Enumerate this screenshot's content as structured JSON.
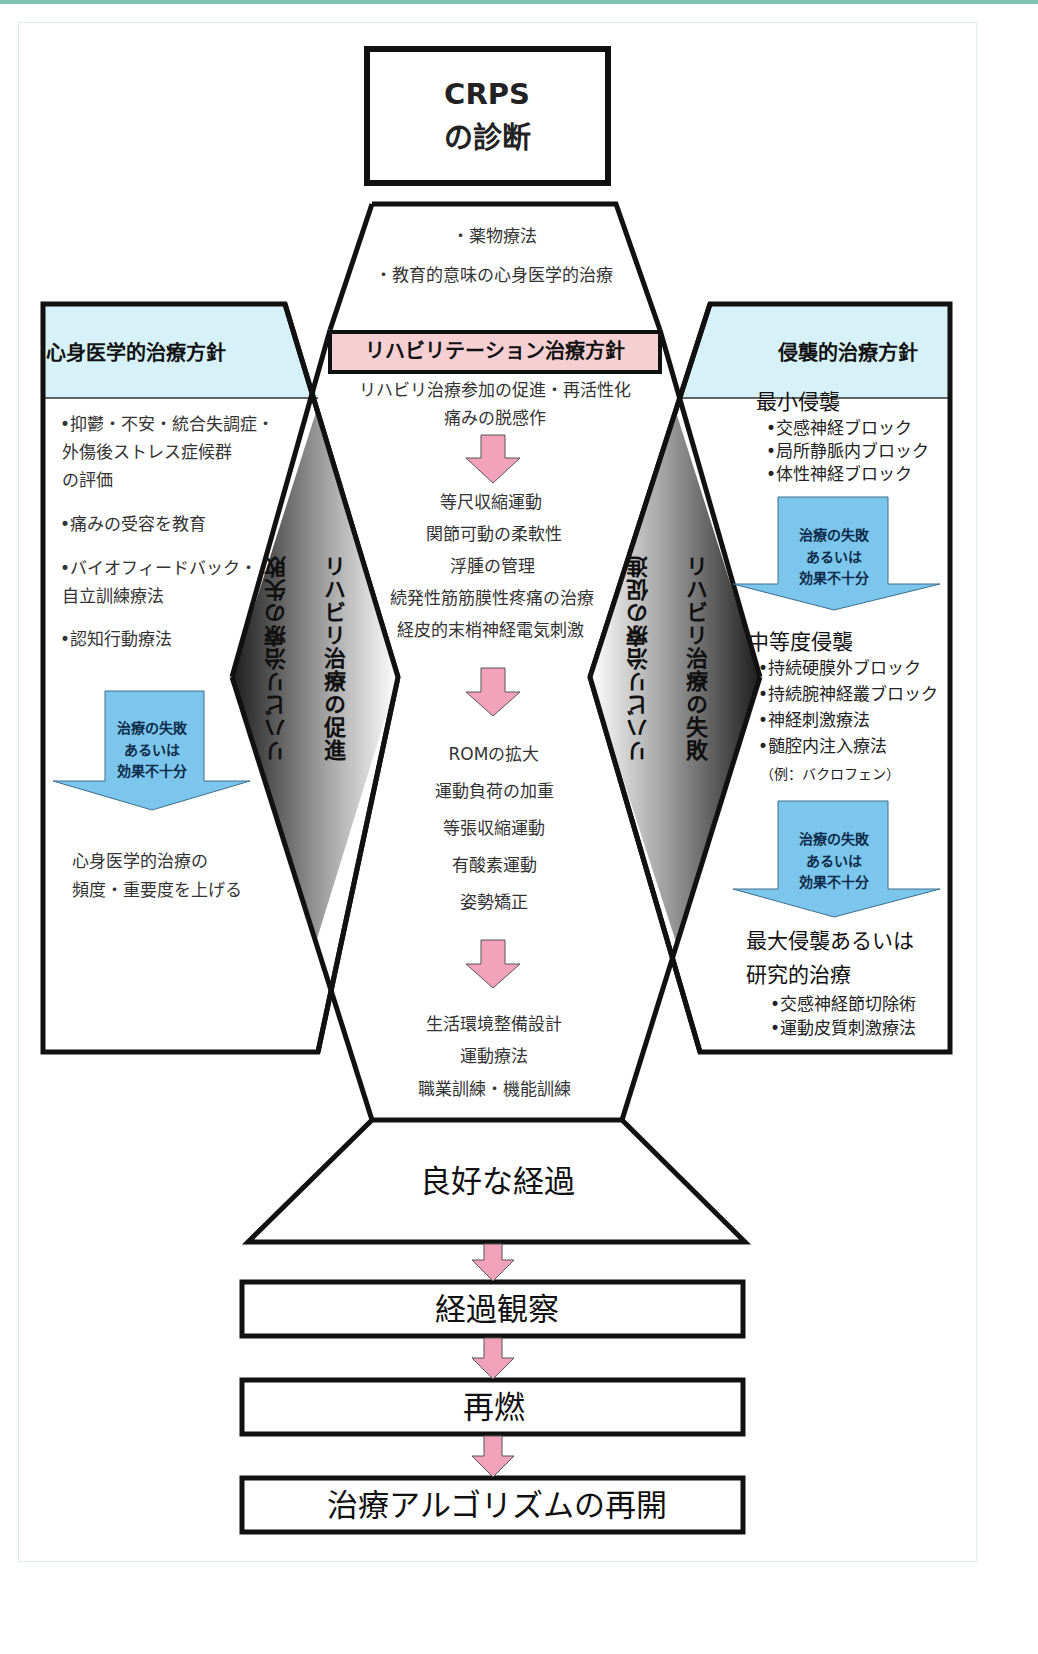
{
  "diagram": {
    "diagnosis_box": {
      "line1": "CRPS",
      "line2": "の診断"
    },
    "initial_treatment": {
      "items": [
        "・薬物療法",
        "・教育的意味の心身医学的治療"
      ]
    },
    "rehab": {
      "header": "リハビリテーション治療方針",
      "intro": [
        "リハビリ治療参加の促進・再活性化",
        "痛みの脱感作"
      ],
      "stage1": [
        "等尺収縮運動",
        "関節可動の柔軟性",
        "浮腫の管理",
        "続発性筋筋膜性疼痛の治療",
        "経皮的末梢神経電気刺激"
      ],
      "stage2": [
        "ROMの拡大",
        "運動負荷の加重",
        "等張収縮運動",
        "有酸素運動",
        "姿勢矯正"
      ],
      "stage3": [
        "生活環境整備設計",
        "運動療法",
        "職業訓練・機能訓練"
      ]
    },
    "psychosomatic": {
      "header": "心身医学的治療方針",
      "items": [
        [
          "•抑鬱・不安・統合失調症・",
          "外傷後ストレス症候群",
          "の評価"
        ],
        [
          "•痛みの受容を教育"
        ],
        [
          "•バイオフィードバック・",
          "自立訓練療法"
        ],
        [
          "•認知行動療法"
        ]
      ],
      "failure_arrow": [
        "治療の失敗",
        "あるいは",
        "効果不十分"
      ],
      "escalation": [
        "心身医学的治療の",
        "頻度・重要度を上げる"
      ]
    },
    "invasive": {
      "header": "侵襲的治療方針",
      "minimal": {
        "title": "最小侵襲",
        "items": [
          "•交感神経ブロック",
          "•局所静脈内ブロック",
          "•体性神経ブロック"
        ]
      },
      "failure_arrow_1": [
        "治療の失敗",
        "あるいは",
        "効果不十分"
      ],
      "moderate": {
        "title": "中等度侵襲",
        "items": [
          "•持続硬膜外ブロック",
          "•持続腕神経叢ブロック",
          "•神経刺激療法",
          "•髄腔内注入療法"
        ],
        "note": "（例：バクロフェン）"
      },
      "failure_arrow_2": [
        "治療の失敗",
        "あるいは",
        "効果不十分"
      ],
      "maximal": {
        "title_lines": [
          "最大侵襲あるいは",
          "研究的治療"
        ],
        "items": [
          "•交感神経節切除術",
          "•運動皮質刺激療法"
        ]
      }
    },
    "left_diamond": {
      "outer_label": "リハビリ治療の失敗",
      "inner_label": "リハビリ治療の促進"
    },
    "right_diamond": {
      "inner_label": "リハビリ治療の促進",
      "outer_label": "リハビリ治療の失敗"
    },
    "outcome": "良好な経過",
    "followup": [
      "経過観察",
      "再燃",
      "治療アルゴリズムの再開"
    ],
    "colors": {
      "panel_header_blue": "#d6f2f8",
      "failure_arrow_blue": "#7cc6ee",
      "rehab_header_pink": "#f5cfd1",
      "progress_arrow_pink": "#f2a3bb",
      "stroke": "#111111",
      "top_accent": "#7cc4b0"
    }
  }
}
